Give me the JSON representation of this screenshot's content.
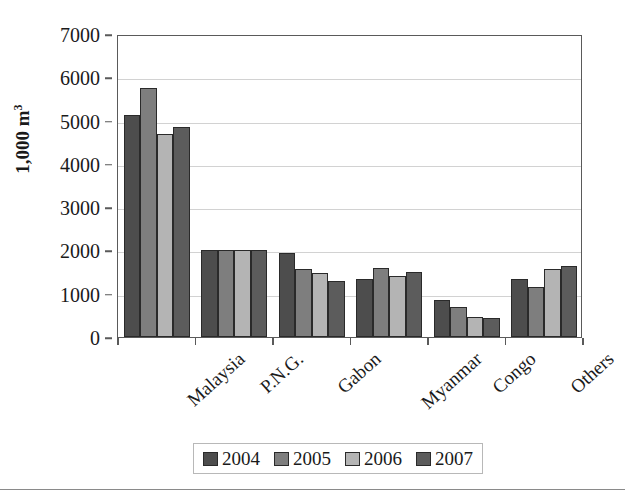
{
  "chart_data": {
    "type": "bar",
    "title": "",
    "xlabel": "",
    "ylabel": "1,000 m",
    "ylabel_sup": "3",
    "categories": [
      "Malaysia",
      "P.N.G.",
      "Gabon",
      "Myanmar",
      "Congo",
      "Others"
    ],
    "series": [
      {
        "name": "2004",
        "color": "#4d4d4d",
        "values": [
          5120,
          2010,
          1940,
          1350,
          850,
          1330
        ]
      },
      {
        "name": "2005",
        "color": "#7e7e7e",
        "values": [
          5750,
          2010,
          1580,
          1600,
          700,
          1160
        ]
      },
      {
        "name": "2006",
        "color": "#b4b4b4",
        "values": [
          4700,
          2010,
          1470,
          1400,
          470,
          1560
        ]
      },
      {
        "name": "2007",
        "color": "#5c5c5c",
        "values": [
          4850,
          2010,
          1300,
          1500,
          450,
          1630
        ]
      }
    ],
    "ylim": [
      0,
      7000
    ],
    "yticks": [
      0,
      1000,
      2000,
      3000,
      4000,
      5000,
      6000,
      7000
    ],
    "ytick_labels": [
      "0",
      "1000",
      "2000",
      "3000",
      "4000",
      "5000",
      "6000",
      "7000"
    ],
    "grid": "horizontal",
    "legend_position": "bottom",
    "legend_entries": [
      "2004",
      "2005",
      "2006",
      "2007"
    ]
  }
}
